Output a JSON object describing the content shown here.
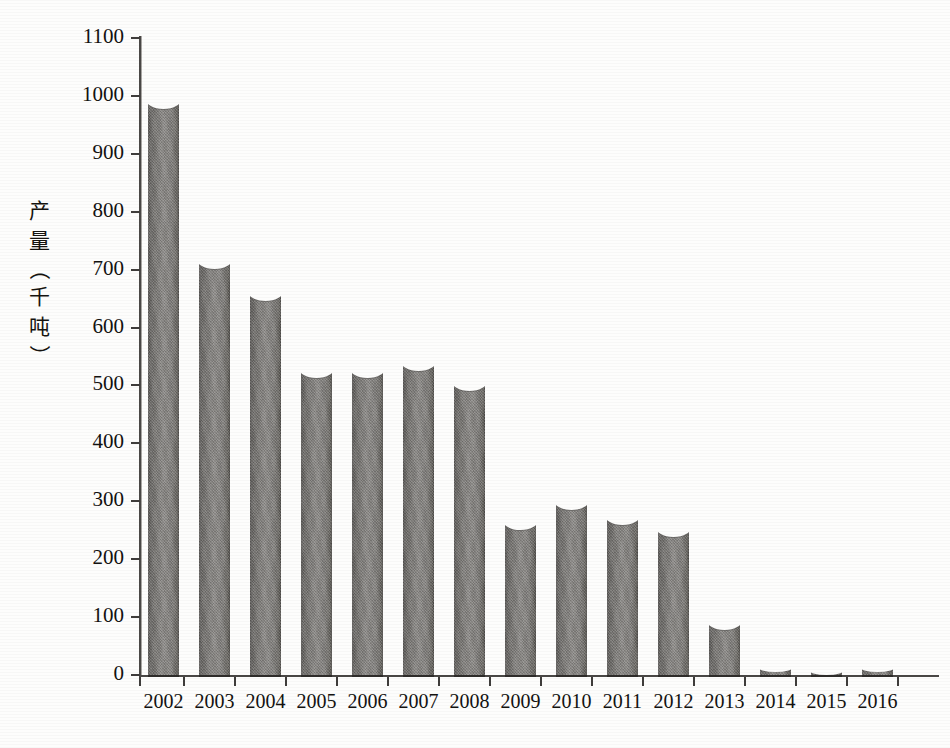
{
  "chart_data": {
    "type": "bar",
    "title": "",
    "subtitle": "",
    "xlabel": "",
    "ylabel": "产量（千吨）",
    "ylabel_chars": [
      "产",
      "量",
      "（",
      "千",
      "吨",
      "）"
    ],
    "categories": [
      "2002",
      "2003",
      "2004",
      "2005",
      "2006",
      "2007",
      "2008",
      "2009",
      "2010",
      "2011",
      "2012",
      "2013",
      "2014",
      "2015",
      "2016"
    ],
    "values": [
      995,
      718,
      663,
      530,
      530,
      542,
      508,
      268,
      303,
      277,
      255,
      95,
      12,
      7,
      12
    ],
    "series": [
      {
        "name": "产量",
        "values": [
          995,
          718,
          663,
          530,
          530,
          542,
          508,
          268,
          303,
          277,
          255,
          95,
          12,
          7,
          12
        ]
      }
    ],
    "ylim": [
      0,
      1100
    ],
    "ytick_values": [
      0,
      100,
      200,
      300,
      400,
      500,
      600,
      700,
      800,
      900,
      1000,
      1100
    ],
    "ytick_labels": [
      "0",
      "100",
      "200",
      "300",
      "400",
      "500",
      "600",
      "700",
      "800",
      "900",
      "1000",
      "1100"
    ],
    "grid": false,
    "legend": false,
    "legend_position": "none",
    "bar_color": "#7e7c79",
    "axis_color": "#3f3d3b",
    "background_color": "#fdfdfc",
    "text_color": "#131210"
  }
}
